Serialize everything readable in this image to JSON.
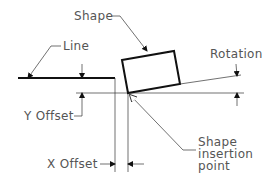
{
  "diagram": {
    "labels": {
      "shape": "Shape",
      "line": "Line",
      "rotation": "Rotation",
      "y_offset": "Y Offset",
      "x_offset": "X Offset",
      "insertion_line1": "Shape",
      "insertion_line2": "insertion",
      "insertion_line3": "point"
    },
    "colors": {
      "stroke": "#111111",
      "text": "#555555",
      "background": "#ffffff"
    }
  }
}
